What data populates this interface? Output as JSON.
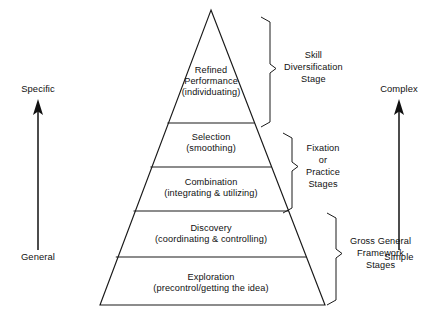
{
  "figure": {
    "type": "pyramid-diagram",
    "title": "",
    "background_color": "#ffffff",
    "line_color": "#1a1a1a"
  },
  "pyramid": {
    "tiers": [
      {
        "id": "tier-refined-performance",
        "main": "Refined",
        "main2": "Performance",
        "sub": "(individuating)",
        "level": 1
      },
      {
        "id": "tier-selection",
        "main": "Selection",
        "sub": "(smoothing)",
        "level": 2
      },
      {
        "id": "tier-combination",
        "main": "Combination",
        "sub": "(integrating & utilizing)",
        "level": 3
      },
      {
        "id": "tier-discovery",
        "main": "Discovery",
        "sub": "(coordinating & controlling)",
        "level": 4
      },
      {
        "id": "tier-exploration",
        "main": "Exploration",
        "sub": "(precontrol/getting the idea)",
        "level": 5
      }
    ]
  },
  "brackets": [
    {
      "id": "bracket-skill-diversification",
      "lines": [
        "Skill",
        "Diversification",
        "Stage"
      ]
    },
    {
      "id": "bracket-fixation-practice",
      "lines": [
        "Fixation",
        "or",
        "Practice",
        "Stages"
      ]
    },
    {
      "id": "bracket-gross-general",
      "lines": [
        "Gross General",
        "Framework",
        "Stages"
      ]
    }
  ],
  "axes": {
    "left": {
      "id": "axis-specific-general",
      "top_label": "Specific",
      "bottom_label": "General",
      "direction": "up"
    },
    "right": {
      "id": "axis-complex-simple",
      "top_label": "Complex",
      "bottom_label": "Simple",
      "direction": "up"
    }
  }
}
